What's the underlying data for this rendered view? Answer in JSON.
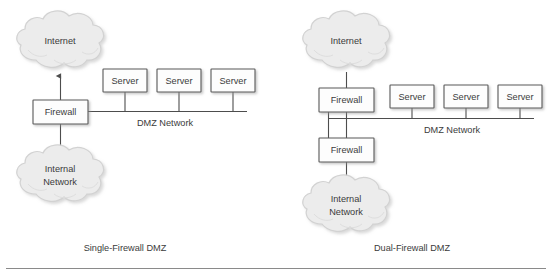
{
  "figure": {
    "background_color": "#ffffff",
    "line_color": "#4d4d4d",
    "box_fill": "#fdfdfd",
    "box_stroke": "#585858",
    "cloud_fill": "#ececec",
    "cloud_stroke": "#d2d2d2",
    "text_color": "#3b3b3b",
    "rule_color": "#8a8a8a"
  },
  "diagrams": [
    {
      "id": "single-firewall",
      "caption": "Single-Firewall DMZ",
      "internet_cloud_label": "Internet",
      "internal_cloud_label_line1": "Internal",
      "internal_cloud_label_line2": "Network",
      "firewalls": [
        {
          "label": "Firewall"
        }
      ],
      "servers": [
        {
          "label": "Server"
        },
        {
          "label": "Server"
        },
        {
          "label": "Server"
        }
      ],
      "network_label": "DMZ Network"
    },
    {
      "id": "dual-firewall",
      "caption": "Dual-Firewall DMZ",
      "internet_cloud_label": "Internet",
      "internal_cloud_label_line1": "Internal",
      "internal_cloud_label_line2": "Network",
      "firewalls": [
        {
          "label": "Firewall"
        },
        {
          "label": "Firewall"
        }
      ],
      "servers": [
        {
          "label": "Server"
        },
        {
          "label": "Server"
        },
        {
          "label": "Server"
        }
      ],
      "network_label": "DMZ Network"
    }
  ]
}
